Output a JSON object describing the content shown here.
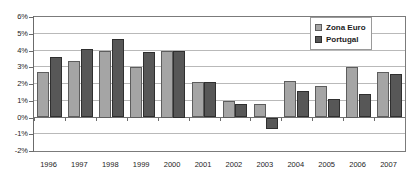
{
  "chart_data": {
    "type": "bar",
    "title": "",
    "subtitle": "",
    "xlabel": "",
    "ylabel": "",
    "categories": [
      "1996",
      "1997",
      "1998",
      "1999",
      "2000",
      "2001",
      "2002",
      "2003",
      "2004",
      "2005",
      "2006",
      "2007"
    ],
    "series": [
      {
        "name": "Zona Euro",
        "color": "#a5a5a5",
        "values": [
          2.7,
          3.4,
          4.0,
          3.0,
          4.0,
          2.1,
          1.0,
          0.8,
          2.2,
          1.9,
          3.0,
          2.7
        ]
      },
      {
        "name": "Portugal",
        "color": "#575757",
        "values": [
          3.6,
          4.1,
          4.7,
          3.9,
          4.0,
          2.1,
          0.8,
          -0.7,
          1.6,
          1.1,
          1.4,
          2.6
        ]
      }
    ],
    "ylim": [
      -2,
      6
    ],
    "ytick_values": [
      6,
      5,
      4,
      3,
      2,
      1,
      0,
      -1,
      -2
    ],
    "ytick_labels": [
      "6%",
      "5%",
      "4%",
      "3%",
      "2%",
      "1%",
      "0%",
      "-1%",
      "-2%"
    ],
    "grid": true,
    "grid_axis": "y",
    "legend_position": "top-right",
    "zero_line": true,
    "plot_border": true
  },
  "legend": {
    "items": [
      {
        "label": "Zona Euro",
        "swatch": "light-gray-swatch-icon"
      },
      {
        "label": "Portugal",
        "swatch": "dark-gray-swatch-icon"
      }
    ]
  }
}
